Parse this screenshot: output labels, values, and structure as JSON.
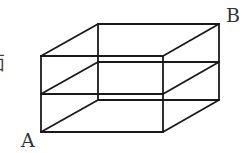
{
  "figure": {
    "type": "cuboid-with-mid-section",
    "line_color": "#1a1a1a",
    "label_color": "#333333"
  },
  "labels": {
    "vertex_a": "A",
    "vertex_b": "B",
    "clipped_left_text": "面"
  }
}
